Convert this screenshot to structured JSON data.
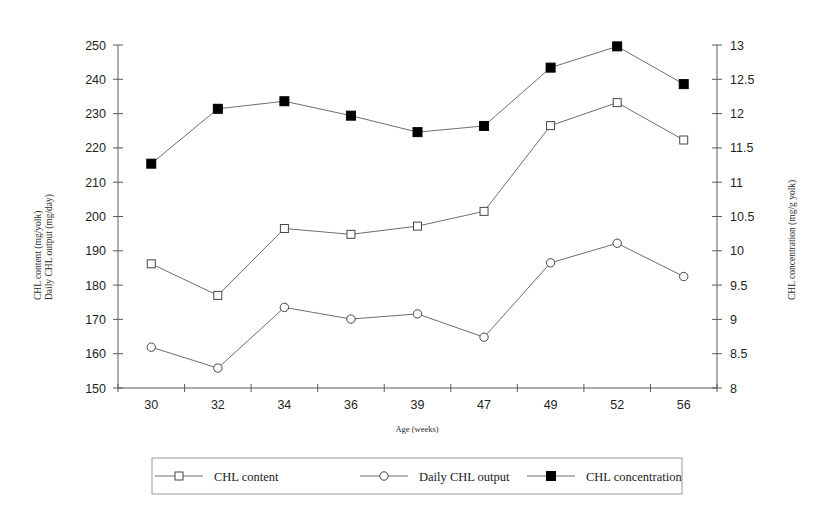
{
  "chart_data": {
    "type": "line",
    "title": "",
    "xlabel": "Age (weeks)",
    "ylabel": "CHL content (mg/yolk)\nDaily CHL output (mg/day)",
    "ylabel_line1": "CHL content (mg/yolk)",
    "ylabel_line2": "Daily CHL output (mg/day)",
    "y2label": "CHL concentration (mg/g yolk)",
    "categories": [
      "30",
      "32",
      "34",
      "36",
      "39",
      "47",
      "49",
      "52",
      "56"
    ],
    "ylim": [
      150,
      250
    ],
    "yticks": [
      "150",
      "160",
      "170",
      "180",
      "190",
      "200",
      "210",
      "220",
      "230",
      "240",
      "250"
    ],
    "y2lim": [
      8,
      13
    ],
    "y2ticks": [
      "8",
      "8.5",
      "9",
      "9.5",
      "10",
      "10.5",
      "11",
      "11.5",
      "12",
      "12.5",
      "13"
    ],
    "grid": false,
    "legend_position": "bottom",
    "series": [
      {
        "name": "CHL content",
        "axis": "left",
        "marker": "open-square",
        "values": [
          186.2,
          177.0,
          196.5,
          194.8,
          197.2,
          201.5,
          226.5,
          233.2,
          222.3
        ]
      },
      {
        "name": "Daily CHL output",
        "axis": "left",
        "marker": "open-circle",
        "values": [
          161.9,
          155.8,
          173.5,
          170.1,
          171.6,
          164.8,
          186.5,
          192.2,
          182.5
        ]
      },
      {
        "name": "CHL concentration",
        "axis": "right",
        "marker": "filled-square",
        "values": [
          11.27,
          12.07,
          12.18,
          11.97,
          11.73,
          11.82,
          12.67,
          12.98,
          12.43
        ]
      }
    ]
  },
  "legend": {
    "items": [
      {
        "label": "CHL content",
        "marker": "open-square"
      },
      {
        "label": "Daily CHL output",
        "marker": "open-circle"
      },
      {
        "label": "CHL concentration",
        "marker": "filled-square"
      }
    ]
  },
  "colors": {
    "line": "#6e6e6e",
    "axis": "#5a5a5a",
    "marker_fill_open": "#ffffff",
    "marker_fill_solid": "#000000",
    "text": "#1a1a1a",
    "legend_border": "#9a9a9a"
  }
}
